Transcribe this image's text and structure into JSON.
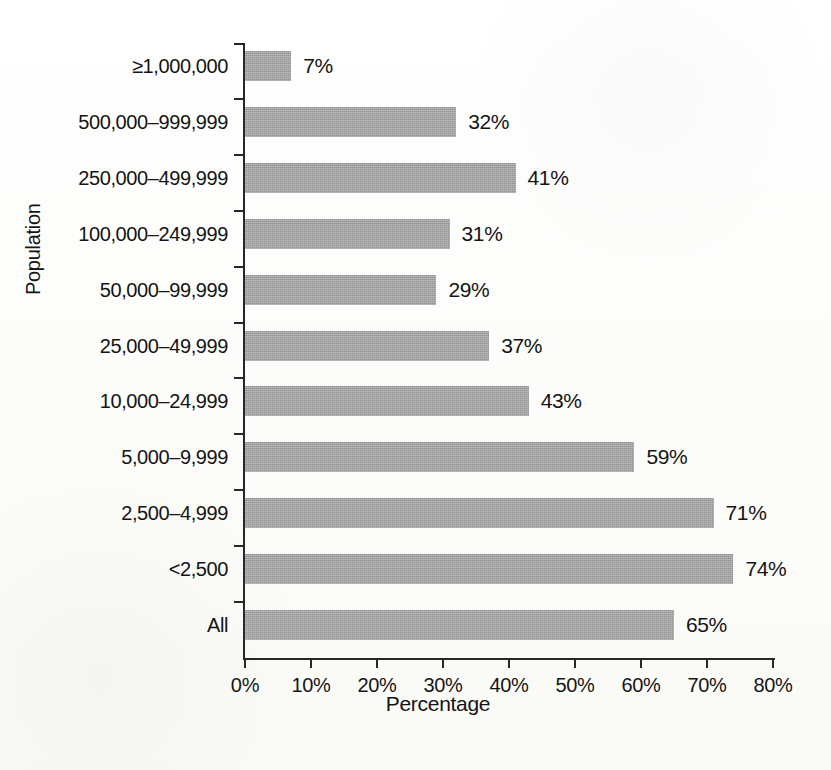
{
  "chart_data": {
    "type": "bar",
    "orientation": "horizontal",
    "title": "",
    "xlabel": "Percentage",
    "ylabel": "Population",
    "xlim": [
      0,
      80
    ],
    "xticks": [
      "0%",
      "10%",
      "20%",
      "30%",
      "40%",
      "50%",
      "60%",
      "70%",
      "80%"
    ],
    "xtick_values": [
      0,
      10,
      20,
      30,
      40,
      50,
      60,
      70,
      80
    ],
    "grid": false,
    "legend": null,
    "bar_color": "#a3a3a3",
    "categories": [
      "≥1,000,000",
      "500,000–999,999",
      "250,000–499,999",
      "100,000–249,999",
      "50,000–99,999",
      "25,000–49,999",
      "10,000–24,999",
      "5,000–9,999",
      "2,500–4,999",
      "<2,500",
      "All"
    ],
    "values": [
      7,
      32,
      41,
      31,
      29,
      37,
      43,
      59,
      71,
      74,
      65
    ],
    "data_labels": [
      "7%",
      "32%",
      "41%",
      "31%",
      "29%",
      "37%",
      "43%",
      "59%",
      "71%",
      "74%",
      "65%"
    ]
  }
}
